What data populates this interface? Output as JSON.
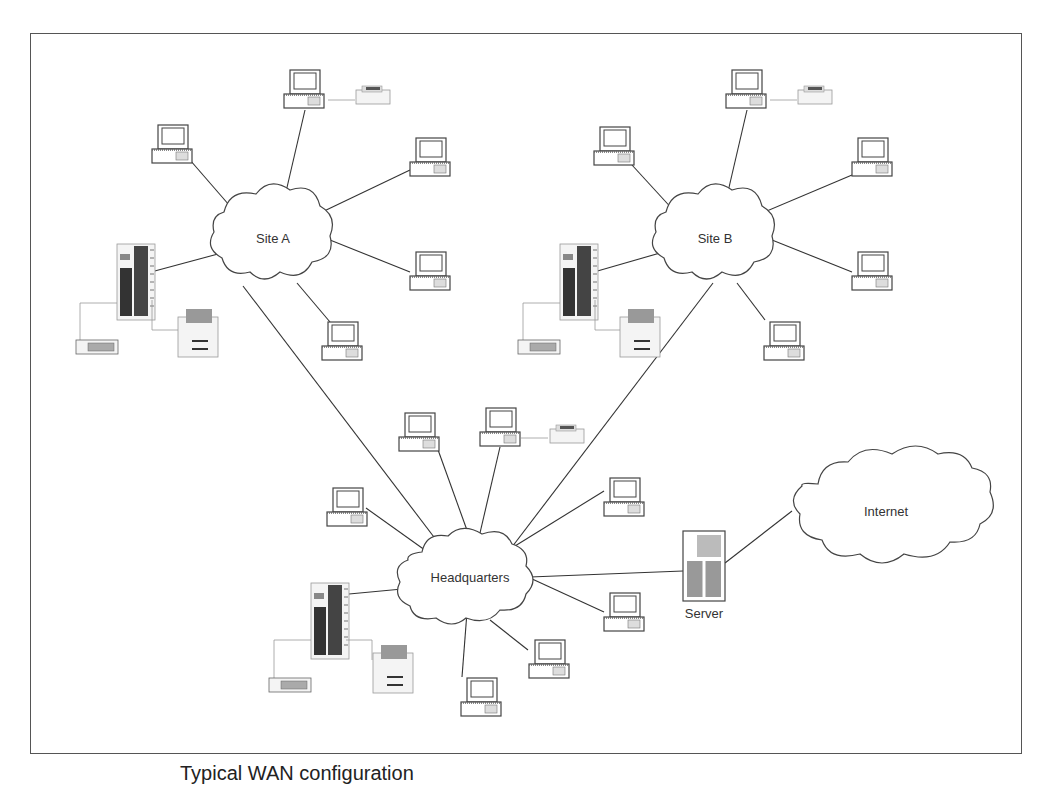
{
  "diagram": {
    "caption": "Typical WAN configuration",
    "clouds": [
      {
        "id": "site-a",
        "label": "Site A",
        "cx": 273,
        "cy": 238,
        "rx": 58,
        "ry": 48
      },
      {
        "id": "site-b",
        "label": "Site B",
        "cx": 715,
        "cy": 238,
        "rx": 58,
        "ry": 48
      },
      {
        "id": "headquarters",
        "label": "Headquarters",
        "cx": 470,
        "cy": 577,
        "rx": 60,
        "ry": 46
      },
      {
        "id": "internet",
        "label": "Internet",
        "cx": 886,
        "cy": 511,
        "rx": 95,
        "ry": 58
      }
    ],
    "server": {
      "label": "Server",
      "x": 683,
      "y": 531
    },
    "colors": {
      "line": "#333333",
      "stroke": "#444444",
      "frame": "#555555"
    }
  }
}
